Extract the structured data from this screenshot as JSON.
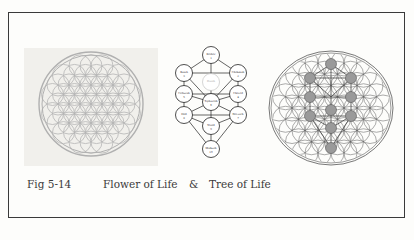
{
  "figure": {
    "number": "Fig 5-14",
    "title_left": "Flower of Life",
    "ampersand": "&",
    "title_right": "Tree of Life"
  },
  "panels": [
    {
      "name": "flower-of-life",
      "color": "#b8b8b8"
    },
    {
      "name": "tree-of-life",
      "nodes": [
        {
          "label": "Kether",
          "num": "1"
        },
        {
          "label": "Binah",
          "num": "3"
        },
        {
          "label": "Chokmah",
          "num": "2"
        },
        {
          "label": "Daath",
          "num": ""
        },
        {
          "label": "Geburah",
          "num": "5"
        },
        {
          "label": "Chesed",
          "num": "4"
        },
        {
          "label": "Tiphareth",
          "num": "6"
        },
        {
          "label": "Hod",
          "num": "8"
        },
        {
          "label": "Netzach",
          "num": "7"
        },
        {
          "label": "Yesod",
          "num": "9"
        },
        {
          "label": "Malkuth",
          "num": "10"
        }
      ]
    },
    {
      "name": "flower-with-tree-overlay",
      "line_color": "#555555",
      "node_fill": "#9a9a9a"
    }
  ]
}
